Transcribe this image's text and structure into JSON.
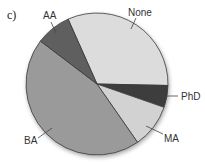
{
  "panel_label": "c)",
  "chart_data": {
    "type": "pie",
    "title": "",
    "categories": [
      "None",
      "PhD",
      "MA",
      "BA",
      "AA"
    ],
    "values": [
      32,
      5,
      10,
      45,
      8
    ],
    "unit": "percent (estimated)",
    "start_angle_deg": -24,
    "direction": "clockwise",
    "colors": {
      "None": "#dcdcdc",
      "PhD": "#3c3c3c",
      "MA": "#d2d2d2",
      "BA": "#9a9a9a",
      "AA": "#5e5e5e"
    },
    "legend": "none (direct callout labels)"
  },
  "labels": {
    "none": "None",
    "phd": "PhD",
    "ma": "MA",
    "ba": "BA",
    "aa": "AA"
  }
}
